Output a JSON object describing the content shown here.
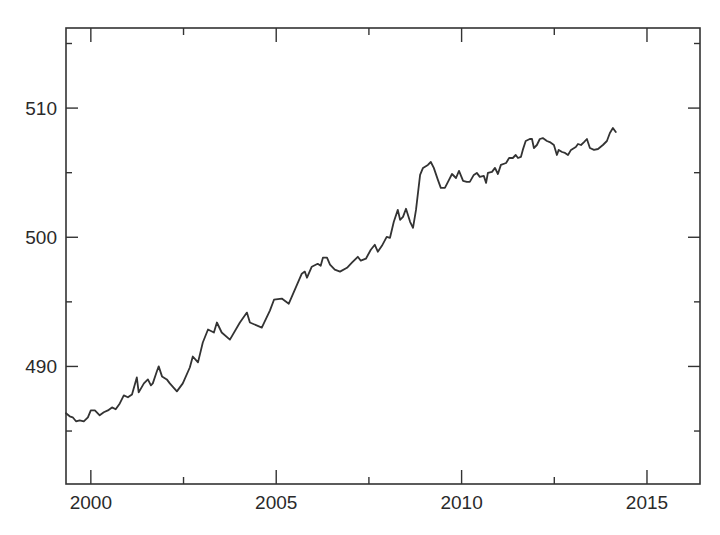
{
  "chart_data": {
    "type": "line",
    "title": "",
    "xlabel": "",
    "ylabel": "",
    "xlim": [
      1999.33,
      2016.43
    ],
    "ylim": [
      480.9,
      516.2
    ],
    "grid": false,
    "legend": null,
    "x_ticks": [
      {
        "value": 2000,
        "label": "2000"
      },
      {
        "value": 2005,
        "label": "2005"
      },
      {
        "value": 2010,
        "label": "2010"
      },
      {
        "value": 2015,
        "label": "2015"
      }
    ],
    "x_minor_ticks": [
      2002.5,
      2007.5,
      2012.5
    ],
    "y_ticks": [
      {
        "value": 490,
        "label": "490"
      },
      {
        "value": 500,
        "label": "500"
      },
      {
        "value": 510,
        "label": "510"
      }
    ],
    "y_minor_ticks": [
      485,
      495,
      505,
      515
    ],
    "line_color": "#333333",
    "series": [
      {
        "name": "series",
        "x": [
          1999.33,
          1999.43,
          1999.51,
          1999.6,
          1999.7,
          1999.81,
          1999.92,
          2000.0,
          2000.11,
          2000.24,
          2000.35,
          2000.46,
          2000.57,
          2000.67,
          2000.78,
          2000.89,
          2001.0,
          2001.11,
          2001.24,
          2001.29,
          2001.43,
          2001.54,
          2001.62,
          2001.67,
          2001.78,
          2001.83,
          2001.92,
          2002.05,
          2002.13,
          2002.32,
          2002.48,
          2002.67,
          2002.75,
          2002.89,
          2003.02,
          2003.16,
          2003.32,
          2003.4,
          2003.53,
          2003.75,
          2004.02,
          2004.21,
          2004.29,
          2004.61,
          2004.83,
          2004.94,
          2005.15,
          2005.34,
          2005.69,
          2005.77,
          2005.83,
          2005.96,
          2006.12,
          2006.2,
          2006.26,
          2006.37,
          2006.45,
          2006.58,
          2006.72,
          2006.91,
          2007.04,
          2007.2,
          2007.28,
          2007.42,
          2007.55,
          2007.66,
          2007.74,
          2007.85,
          2007.98,
          2008.07,
          2008.17,
          2008.28,
          2008.34,
          2008.42,
          2008.5,
          2008.61,
          2008.69,
          2008.77,
          2008.88,
          2008.96,
          2009.09,
          2009.17,
          2009.25,
          2009.36,
          2009.44,
          2009.55,
          2009.66,
          2009.74,
          2009.85,
          2009.93,
          2010.04,
          2010.14,
          2010.22,
          2010.33,
          2010.41,
          2010.49,
          2010.6,
          2010.66,
          2010.71,
          2010.82,
          2010.9,
          2010.98,
          2011.06,
          2011.2,
          2011.28,
          2011.38,
          2011.46,
          2011.52,
          2011.6,
          2011.65,
          2011.73,
          2011.84,
          2011.9,
          2011.95,
          2012.03,
          2012.11,
          2012.19,
          2012.3,
          2012.38,
          2012.49,
          2012.57,
          2012.62,
          2012.71,
          2012.79,
          2012.87,
          2012.95,
          2013.08,
          2013.14,
          2013.22,
          2013.3,
          2013.38,
          2013.46,
          2013.57,
          2013.68,
          2013.81,
          2013.92,
          2014.0,
          2014.08,
          2014.16
        ],
        "values": [
          486.37,
          486.14,
          486.06,
          485.75,
          485.83,
          485.75,
          486.06,
          486.6,
          486.6,
          486.22,
          486.45,
          486.6,
          486.83,
          486.68,
          487.14,
          487.76,
          487.61,
          487.84,
          489.15,
          487.99,
          488.69,
          489.0,
          488.53,
          488.69,
          489.61,
          490.0,
          489.23,
          489.0,
          488.69,
          488.07,
          488.69,
          489.92,
          490.77,
          490.31,
          491.85,
          492.86,
          492.63,
          493.4,
          492.63,
          492.08,
          493.4,
          494.17,
          493.4,
          493.01,
          494.32,
          495.17,
          495.25,
          494.86,
          497.18,
          497.34,
          496.87,
          497.72,
          497.95,
          497.8,
          498.42,
          498.42,
          497.88,
          497.49,
          497.34,
          497.64,
          498.03,
          498.49,
          498.19,
          498.34,
          499.03,
          499.42,
          498.88,
          499.34,
          500.04,
          499.96,
          501.2,
          502.12,
          501.35,
          501.58,
          502.2,
          501.2,
          500.73,
          502.12,
          504.83,
          505.37,
          505.6,
          505.83,
          505.37,
          504.44,
          503.82,
          503.82,
          504.44,
          504.9,
          504.59,
          505.14,
          504.36,
          504.29,
          504.29,
          504.83,
          504.98,
          504.67,
          504.75,
          504.21,
          504.98,
          505.06,
          505.37,
          504.9,
          505.6,
          505.75,
          506.14,
          506.14,
          506.37,
          506.14,
          506.22,
          506.76,
          507.45,
          507.61,
          507.61,
          506.91,
          507.14,
          507.61,
          507.68,
          507.45,
          507.37,
          507.14,
          506.37,
          506.76,
          506.6,
          506.53,
          506.37,
          506.76,
          506.99,
          507.22,
          507.14,
          507.37,
          507.61,
          506.91,
          506.76,
          506.83,
          507.14,
          507.45,
          508.07,
          508.46,
          508.15
        ]
      }
    ]
  }
}
